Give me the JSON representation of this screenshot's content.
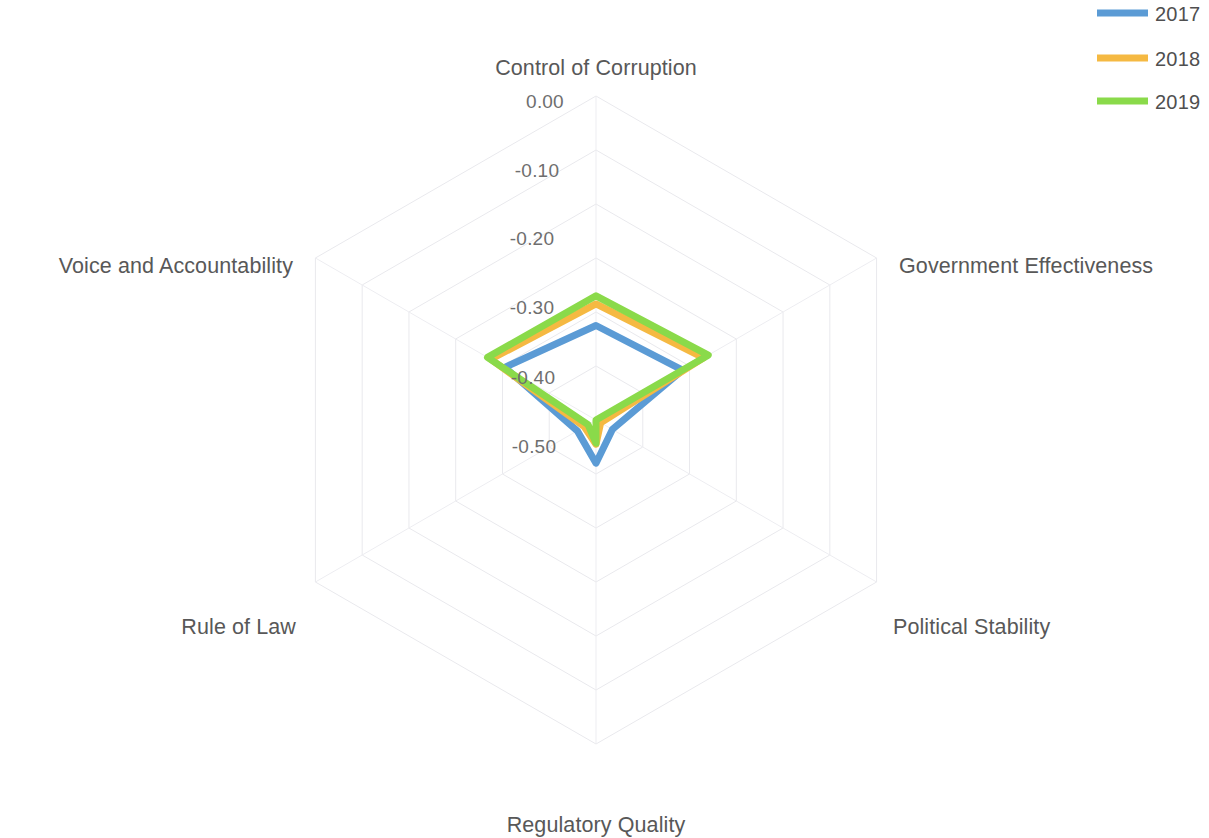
{
  "chart_data": {
    "type": "radar",
    "title": "",
    "categories": [
      "Control of Corruption",
      "Government Effectiveness",
      "Political Stability",
      "Regulatory Quality",
      "Rule of Law",
      "Voice and Accountability"
    ],
    "tick_labels": [
      "0.00",
      "-0.10",
      "-0.20",
      "-0.30",
      "-0.40",
      "-0.50"
    ],
    "tick_values": [
      0.0,
      -0.1,
      -0.2,
      -0.3,
      -0.4,
      -0.5
    ],
    "rlim": [
      -0.6,
      0.0
    ],
    "grid": true,
    "legend_position": "top-right",
    "series": [
      {
        "name": "2017",
        "color": "#5b9bd5",
        "values": [
          -0.425,
          -0.415,
          -0.565,
          -0.52,
          -0.56,
          -0.405
        ]
      },
      {
        "name": "2018",
        "color": "#f5b942",
        "values": [
          -0.385,
          -0.37,
          -0.59,
          -0.555,
          -0.575,
          -0.375
        ]
      },
      {
        "name": "2019",
        "color": "#8ada4a",
        "values": [
          -0.37,
          -0.36,
          -0.6,
          -0.557,
          -0.583,
          -0.368
        ]
      }
    ]
  },
  "legend": {
    "entries": [
      {
        "label": "2017",
        "color": "#5b9bd5"
      },
      {
        "label": "2018",
        "color": "#f5b942"
      },
      {
        "label": "2019",
        "color": "#8ada4a"
      }
    ]
  },
  "axes": {
    "control_of_corruption": "Control of Corruption",
    "government_effectiveness": "Government Effectiveness",
    "political_stability": "Political Stability",
    "regulatory_quality": "Regulatory Quality",
    "rule_of_law": "Rule of Law",
    "voice_and_accountability": "Voice and Accountability"
  },
  "ticks": {
    "t0": "0.00",
    "t1": "-0.10",
    "t2": "-0.20",
    "t3": "-0.30",
    "t4": "-0.40",
    "t5": "-0.50"
  }
}
